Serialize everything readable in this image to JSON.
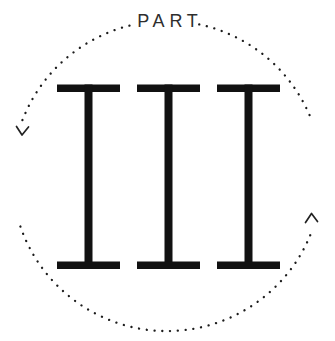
{
  "badge": {
    "part_label": "PART",
    "numeral": "III",
    "icons": {
      "frame": "dotted-circle",
      "left_arrow": "chevron-down",
      "right_arrow": "chevron-up"
    },
    "colors": {
      "background": "#ffffff",
      "numeral": "#111111",
      "label": "#2e2e2e",
      "dots": "#1c1c1c",
      "arrows": "#222222"
    }
  }
}
